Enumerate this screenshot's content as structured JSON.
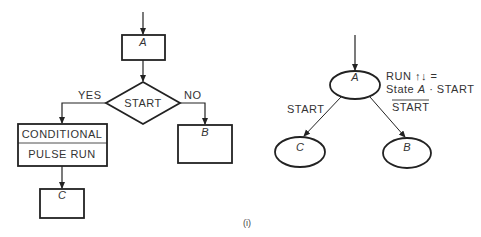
{
  "flowchart": {
    "state_a": "A",
    "decision": "START",
    "yes_label": "YES",
    "no_label": "NO",
    "action_line1": "CONDITIONAL",
    "action_line2": "PULSE RUN",
    "state_b": "B",
    "state_c": "C"
  },
  "state_diagram": {
    "state_a": "A",
    "state_b": "B",
    "state_c": "C",
    "output_line1": "RUN ↑↓ =",
    "output_line2_prefix": "State ",
    "output_line2_state": "A",
    "output_line2_suffix": " · START",
    "transition_to_c": "START",
    "transition_to_b": "START",
    "transition_to_b_negated": true
  },
  "caption": "(i)",
  "colors": {
    "stroke": "#222222",
    "background": "#ffffff"
  }
}
